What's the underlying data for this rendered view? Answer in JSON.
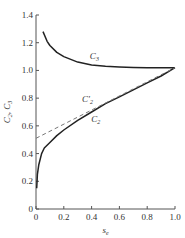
{
  "chart_data": {
    "type": "line",
    "title": "",
    "xlabel": "s_e",
    "ylabel": "C2, C3",
    "xlim": [
      0,
      1.0
    ],
    "ylim": [
      0,
      1.4
    ],
    "grid": false,
    "legend": "inline labels",
    "x_ticks": [
      "0",
      "0.2",
      "0.4",
      "0.6",
      "0.8",
      "1.0"
    ],
    "y_ticks": [
      "0",
      "0.2",
      "0.4",
      "0.6",
      "0.8",
      "1.0",
      "1.2",
      "1.4"
    ],
    "series": [
      {
        "name": "C3",
        "style": "solid",
        "x": [
          0.05,
          0.08,
          0.1,
          0.15,
          0.2,
          0.3,
          0.4,
          0.5,
          0.6,
          0.7,
          0.8,
          0.9,
          1.0
        ],
        "y": [
          1.28,
          1.21,
          1.18,
          1.13,
          1.1,
          1.06,
          1.04,
          1.03,
          1.025,
          1.022,
          1.02,
          1.02,
          1.02
        ]
      },
      {
        "name": "C2",
        "style": "solid",
        "x": [
          0.005,
          0.01,
          0.02,
          0.04,
          0.06,
          0.1,
          0.15,
          0.2,
          0.3,
          0.4,
          0.5,
          0.6,
          0.7,
          0.8,
          0.9,
          1.0
        ],
        "y": [
          0.15,
          0.25,
          0.32,
          0.4,
          0.44,
          0.48,
          0.53,
          0.57,
          0.64,
          0.7,
          0.76,
          0.81,
          0.86,
          0.91,
          0.96,
          1.02
        ]
      },
      {
        "name": "C'2",
        "style": "dashed",
        "x": [
          0.0,
          1.0
        ],
        "y": [
          0.51,
          1.02
        ]
      }
    ],
    "annotations": [
      {
        "text": "C3",
        "x": 0.42,
        "y": 1.08
      },
      {
        "text": "C'2",
        "x": 0.37,
        "y": 0.77
      },
      {
        "text": "C2",
        "x": 0.43,
        "y": 0.63
      }
    ]
  }
}
